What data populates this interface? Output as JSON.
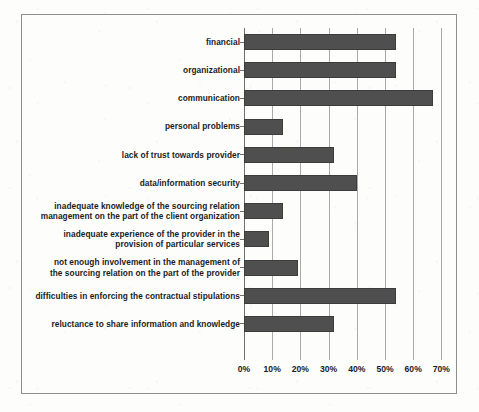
{
  "chart_data": {
    "type": "bar",
    "orientation": "horizontal",
    "title": "",
    "xlabel": "",
    "ylabel": "",
    "xlim": [
      0,
      70
    ],
    "xunit": "%",
    "grid": true,
    "legend": "none",
    "bar_color": "#4f4f4f",
    "categories": [
      "financial",
      "organizational",
      "communication",
      "personal problems",
      "lack of trust towards provider",
      "data/information security",
      "inadequate knowledge of the sourcing relation management on the part of the client organization",
      "inadequate experience of the provider in the provision of particular services",
      "not enough involvement in the management of the sourcing relation on the part of the provider",
      "difficulties in enforcing the contractual stipulations",
      "reluctance to share information and knowledge"
    ],
    "category_lines": [
      [
        "financial"
      ],
      [
        "organizational"
      ],
      [
        "communication"
      ],
      [
        "personal problems"
      ],
      [
        "lack of trust towards provider"
      ],
      [
        "data/information security"
      ],
      [
        "inadequate knowledge of the sourcing relation",
        "management on the part of the client organization"
      ],
      [
        "inadequate experience of the provider in the",
        "provision of particular services"
      ],
      [
        "not enough involvement in the management of",
        "the sourcing relation on the part of the provider"
      ],
      [
        "difficulties in enforcing the contractual stipulations"
      ],
      [
        "reluctance to share information and knowledge"
      ]
    ],
    "values": [
      54,
      54,
      67,
      14,
      32,
      40,
      14,
      9,
      19,
      54,
      32
    ],
    "xticks": [
      0,
      10,
      20,
      30,
      40,
      50,
      60,
      70
    ],
    "xticklabels": [
      "0%",
      "10%",
      "20%",
      "30%",
      "40%",
      "50%",
      "60%",
      "70%"
    ]
  }
}
